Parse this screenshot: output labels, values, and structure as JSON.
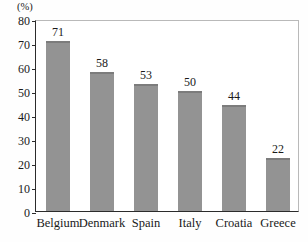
{
  "chart_data": {
    "type": "bar",
    "title": "",
    "subtitle": "",
    "xlabel": "",
    "ylabel": "(%)",
    "unit_label": "(%)",
    "categories": [
      "Belgium",
      "Denmark",
      "Spain",
      "Italy",
      "Croatia",
      "Greece"
    ],
    "values": [
      71,
      58,
      53,
      50,
      44,
      22
    ],
    "value_labels": [
      "71",
      "58",
      "53",
      "50",
      "44",
      "22"
    ],
    "ylim": [
      0,
      80
    ],
    "ytick_step": 10,
    "ytick_labels": [
      "80",
      "70",
      "60",
      "50",
      "40",
      "30",
      "20",
      "10",
      "0"
    ],
    "ytick_values": [
      80,
      70,
      60,
      50,
      40,
      30,
      20,
      10,
      0
    ],
    "grid": false,
    "legend": null,
    "legend_position": "none",
    "annotations": [],
    "colors": {
      "bar_fill": "#939393",
      "bar_top_edge": "#7c7c7c",
      "axis": "#2b2b2b",
      "frame": "#b9b9b9",
      "text": "#1a1a1a",
      "background": "#ffffff"
    }
  }
}
